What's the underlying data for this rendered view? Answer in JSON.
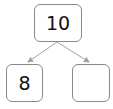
{
  "diagram": {
    "type": "number-bond",
    "whole": "10",
    "parts": [
      "8",
      ""
    ],
    "colors": {
      "border": "#8a8a8a",
      "arrow": "#a0a0a0",
      "text": "#111111"
    }
  }
}
